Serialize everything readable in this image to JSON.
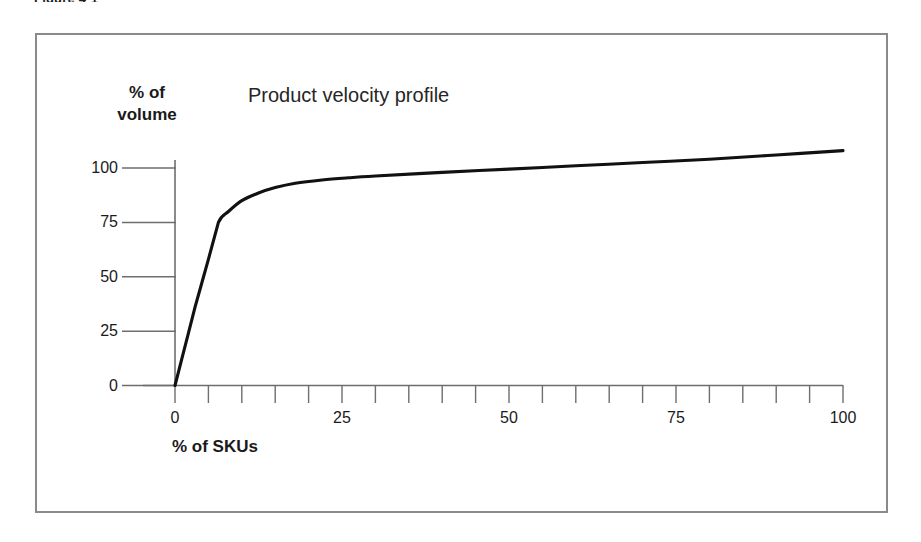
{
  "figure": {
    "caption": "Figure 4-1",
    "frame_color": "#8a8a8a"
  },
  "chart_data": {
    "type": "line",
    "title": "Product velocity profile",
    "xlabel": "% of SKUs",
    "ylabel": "% of volume",
    "xlim": [
      0,
      100
    ],
    "ylim": [
      0,
      110
    ],
    "grid": false,
    "legend": null,
    "line_color": "#111111",
    "x_tick_labels": [
      "0",
      "25",
      "50",
      "75",
      "100"
    ],
    "x_tick_values": [
      0,
      25,
      50,
      75,
      100
    ],
    "x_minor_ticks": [
      0,
      5,
      10,
      15,
      20,
      25,
      30,
      35,
      40,
      45,
      50,
      55,
      60,
      65,
      70,
      75,
      80,
      85,
      90,
      95,
      100
    ],
    "y_tick_labels": [
      "0",
      "25",
      "50",
      "75",
      "100"
    ],
    "y_tick_values": [
      0,
      25,
      50,
      75,
      100
    ],
    "series": [
      {
        "name": "Product velocity profile",
        "x": [
          0,
          1,
          2,
          3,
          4,
          5,
          6.5,
          8,
          10,
          12.5,
          15,
          18,
          22,
          26,
          30,
          40,
          50,
          60,
          70,
          80,
          90,
          100
        ],
        "values": [
          0,
          12,
          24,
          36,
          47,
          58,
          75,
          80,
          85,
          88.5,
          91,
          93,
          94.5,
          95.5,
          96.3,
          98,
          99.5,
          101,
          102.5,
          104,
          106,
          108
        ]
      }
    ],
    "annotations": []
  }
}
